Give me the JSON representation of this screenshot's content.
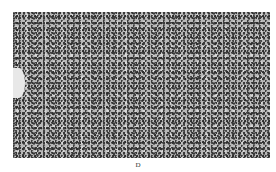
{
  "figure": {
    "colors": {
      "background": "#b8b8b8",
      "nuclei": "#333333",
      "page": "#ffffff"
    }
  },
  "caption": {
    "label": "D"
  }
}
